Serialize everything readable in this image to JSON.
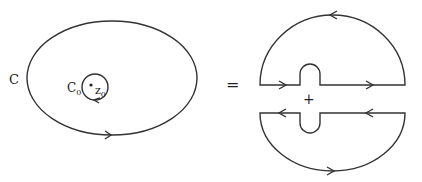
{
  "diagram": {
    "left": {
      "outer_contour_label": "C",
      "inner_contour_label": "C",
      "inner_contour_subscript": "0",
      "point_label": "z",
      "point_subscript": "0",
      "outer_direction": "counterclockwise",
      "inner_direction": "clockwise"
    },
    "operator_equals": "=",
    "operator_plus": "+",
    "right": {
      "upper_piece": "upper half-disk with keyhole bump, counterclockwise",
      "lower_piece": "lower half-disk with keyhole dip, counterclockwise"
    },
    "colors": {
      "stroke": "#333333",
      "background": "#ffffff"
    }
  }
}
